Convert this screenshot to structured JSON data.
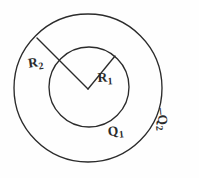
{
  "figure": {
    "stroke_color": "#2b2b2b",
    "background_color": "#fefefe",
    "outer_circle": {
      "name": "outer-shell",
      "center_x": 88,
      "center_y": 88,
      "radius": 74
    },
    "inner_circle": {
      "name": "inner-sphere",
      "center_x": 89,
      "center_y": 87,
      "radius": 40
    },
    "radius_line_outer": {
      "name": "outer-radius-line",
      "x1": 88,
      "y1": 89,
      "x2": 37,
      "y2": 38
    },
    "radius_line_inner": {
      "name": "inner-radius-line",
      "x1": 88,
      "y1": 89,
      "x2": 115,
      "y2": 56
    }
  },
  "labels": {
    "outer_radius": {
      "base": "R",
      "sub": "2"
    },
    "inner_radius": {
      "base": "R",
      "sub": "1"
    },
    "inner_charge": {
      "base": "Q",
      "sub": "1"
    },
    "outer_charge": {
      "dash": "–",
      "base": "Q",
      "sub": "2"
    }
  }
}
